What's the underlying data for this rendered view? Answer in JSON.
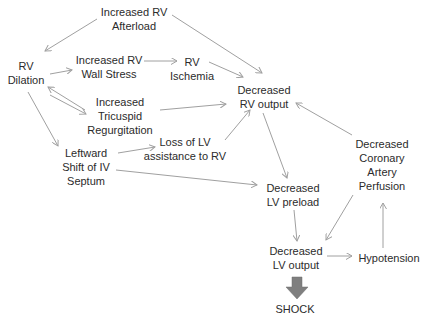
{
  "nodes": {
    "rv_afterload": {
      "line1": "Increased RV",
      "line2": "Afterload"
    },
    "rv_dilation": {
      "line1": "RV",
      "line2": "Dilation"
    },
    "rv_wall_stress": {
      "line1": "Increased RV",
      "line2": "Wall Stress"
    },
    "rv_ischemia": {
      "line1": "RV",
      "line2": "Ischemia"
    },
    "rv_output": {
      "line1": "Decreased",
      "line2": "RV output"
    },
    "tricuspid": {
      "line1": "Increased",
      "line2": "Tricuspid",
      "line3": "Regurgitation"
    },
    "loss_lv": {
      "line1": "Loss of LV",
      "line2": "assistance to RV"
    },
    "septum": {
      "line1": "Leftward",
      "line2": "Shift of IV",
      "line3": "Septum"
    },
    "coronary": {
      "line1": "Decreased",
      "line2": "Coronary",
      "line3": "Artery",
      "line4": "Perfusion"
    },
    "lv_preload": {
      "line1": "Decreased",
      "line2": "LV preload"
    },
    "lv_output": {
      "line1": "Decreased",
      "line2": "LV output"
    },
    "hypotension": {
      "line1": "Hypotension"
    },
    "shock": {
      "line1": "SHOCK"
    }
  },
  "colors": {
    "text": "#2b2b2b",
    "arrow": "#a0a0a0",
    "shock_arrow": "#7f7f7f"
  }
}
